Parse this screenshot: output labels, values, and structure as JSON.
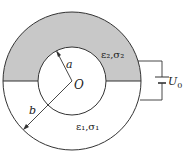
{
  "diagram": {
    "type": "coaxial cylinder with two lossy dielectric layers",
    "colors": {
      "stroke": "#333333",
      "shaded_region": "#c8c8c8",
      "background": "#ffffff"
    },
    "labels": {
      "center": "O",
      "inner_radius": "a",
      "outer_radius": "b",
      "upper_medium": "ε₂,σ₂",
      "lower_medium": "ε₁,σ₁",
      "voltage_symbol": "U",
      "voltage_subscript": "0"
    },
    "regions": [
      {
        "name": "upper-half-annulus",
        "medium": "ε₂,σ₂",
        "shaded": true
      },
      {
        "name": "lower-half-annulus",
        "medium": "ε₁,σ₁",
        "shaded": false
      }
    ]
  }
}
